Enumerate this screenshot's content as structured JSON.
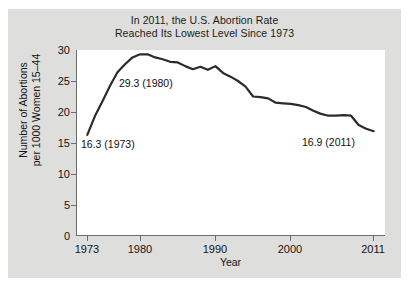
{
  "figure": {
    "background_color": "#ffffff",
    "panel_color": "#dededd",
    "plot_background": "#ffffff",
    "line_color": "#2b2b2b",
    "axis_color": "#6d6d6d",
    "text_color": "#141414"
  },
  "title": {
    "line1": "In 2011, the U.S. Abortion Rate",
    "line2": "Reached Its Lowest Level Since 1973"
  },
  "axes": {
    "ylabel_line1": "Number of Abortions",
    "ylabel_line2": "per 1000 Women 15–44",
    "xlabel": "Year"
  },
  "annotations": {
    "start": "16.3 (1973)",
    "peak": "29.3 (1980)",
    "end": "16.9 (2011)"
  },
  "bottom_artifact": "",
  "chart_data": {
    "type": "line",
    "title": "In 2011, the U.S. Abortion Rate Reached Its Lowest Level Since 1973",
    "xlabel": "Year",
    "ylabel": "Number of Abortions per 1000 Women 15-44",
    "xlim": [
      1971.5,
      2012.5
    ],
    "ylim": [
      0,
      30
    ],
    "xticks": [
      1973,
      1980,
      1990,
      2000,
      2011
    ],
    "xtick_labels": [
      "1973",
      "1980",
      "1990",
      "2000",
      "2011"
    ],
    "yticks": [
      0,
      5,
      10,
      15,
      20,
      25,
      30
    ],
    "ytick_labels": [
      "0",
      "5",
      "10",
      "15",
      "20",
      "25",
      "30"
    ],
    "grid": false,
    "legend": false,
    "series": [
      {
        "name": "U.S. abortion rate per 1000 women aged 15-44",
        "x": [
          1973,
          1974,
          1975,
          1976,
          1977,
          1978,
          1979,
          1980,
          1981,
          1982,
          1983,
          1984,
          1985,
          1986,
          1987,
          1988,
          1989,
          1990,
          1991,
          1992,
          1993,
          1994,
          1995,
          1996,
          1997,
          1998,
          1999,
          2000,
          2001,
          2002,
          2003,
          2004,
          2005,
          2006,
          2007,
          2008,
          2009,
          2010,
          2011
        ],
        "values": [
          16.3,
          19.3,
          21.7,
          24.2,
          26.4,
          27.7,
          28.8,
          29.3,
          29.3,
          28.8,
          28.5,
          28.1,
          28.0,
          27.4,
          26.9,
          27.3,
          26.8,
          27.4,
          26.3,
          25.7,
          25.0,
          24.1,
          22.5,
          22.4,
          22.2,
          21.5,
          21.4,
          21.3,
          21.1,
          20.8,
          20.2,
          19.7,
          19.4,
          19.4,
          19.5,
          19.4,
          17.9,
          17.3,
          16.9
        ]
      }
    ],
    "point_annotations": [
      {
        "x": 1973,
        "y": 16.3,
        "text": "16.3 (1973)"
      },
      {
        "x": 1980,
        "y": 29.3,
        "text": "29.3 (1980)"
      },
      {
        "x": 2011,
        "y": 16.9,
        "text": "16.9 (2011)"
      }
    ]
  }
}
